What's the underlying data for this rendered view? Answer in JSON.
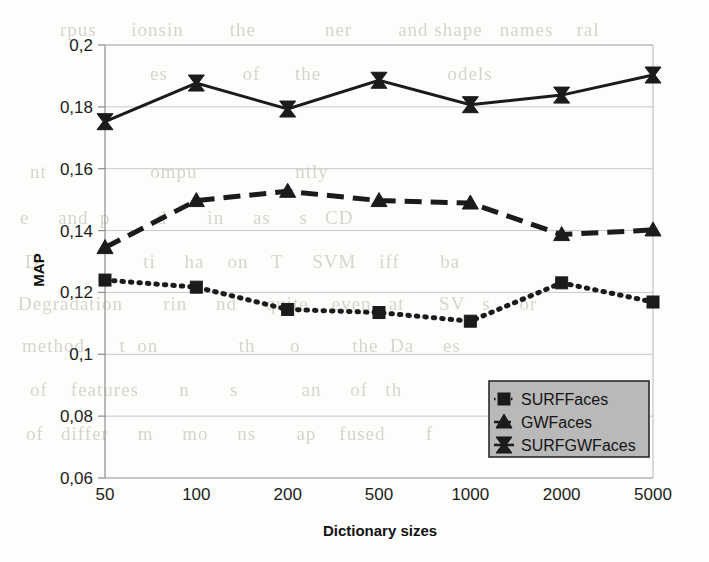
{
  "chart_data": {
    "type": "line",
    "title": "",
    "xlabel": "Dictionary sizes",
    "ylabel": "MAP",
    "categories": [
      "50",
      "100",
      "200",
      "500",
      "1000",
      "2000",
      "5000"
    ],
    "ytick_labels": [
      "0,2",
      "0,18",
      "0,16",
      "0,14",
      "0,12",
      "0,1",
      "0,08",
      "0,06"
    ],
    "ytick_values": [
      0.2,
      0.18,
      0.16,
      0.14,
      0.12,
      0.1,
      0.08,
      0.06
    ],
    "ylim": [
      0.06,
      0.2
    ],
    "grid": "horizontal",
    "legend_position": "inside-bottom-right",
    "decimal_separator": ",",
    "series": [
      {
        "name": "SURFFaces",
        "marker": "square",
        "linestyle": "dotted",
        "color": "#1b1b1b",
        "values": [
          0.124,
          0.1217,
          0.1145,
          0.1135,
          0.1107,
          0.1231,
          0.1169
        ]
      },
      {
        "name": "GWFaces",
        "marker": "triangle",
        "linestyle": "dashed",
        "color": "#1b1b1b",
        "values": [
          0.1345,
          0.1497,
          0.1527,
          0.1497,
          0.1489,
          0.1387,
          0.1402
        ]
      },
      {
        "name": "SURFGWFaces",
        "marker": "bowtie",
        "linestyle": "solid",
        "color": "#1b1b1b",
        "values": [
          0.1752,
          0.1877,
          0.1793,
          0.1886,
          0.1807,
          0.1838,
          0.1903
        ]
      }
    ]
  },
  "legend": {
    "entries": [
      "SURFFaces",
      "GWFaces",
      "SURFGWFaces"
    ]
  },
  "background_text": {
    "note": "faint illegible bleed-through scan text",
    "lines": [
      "rpus      ionsin        the            ner        and shape   names    ral",
      "es             of      the                      odels",
      "nt                  ompu                 ntly",
      "e     and  p        d       in     as     s   CD",
      "D                  ti     ha    on    T     SVM    iff       ba",
      "Degradation       rin     nd     quite    even   at      SV   s     or",
      "method.     t  on              th      o         the  Da     es",
      "of    features       n       s           an     of   th",
      "of   differ     m     mo     ns       ap    fused       f"
    ]
  }
}
